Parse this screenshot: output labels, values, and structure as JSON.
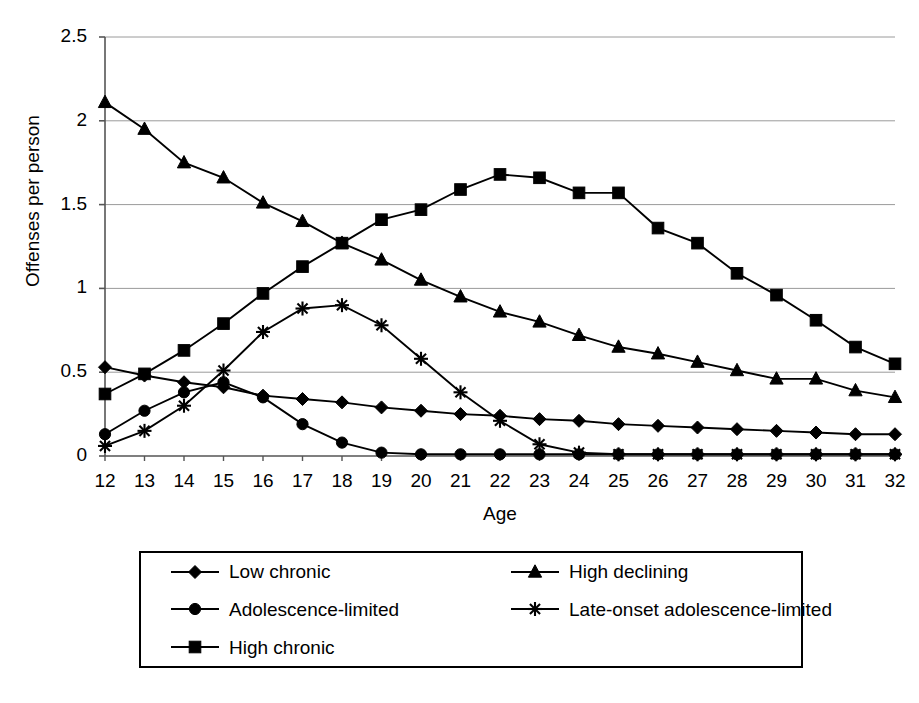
{
  "chart_data": {
    "type": "line",
    "title": "",
    "xlabel": "Age",
    "ylabel": "Offenses per person",
    "xlim": [
      12,
      32
    ],
    "ylim": [
      0,
      2.5
    ],
    "ytick_labels": [
      "0",
      "0.5",
      "1",
      "1.5",
      "2",
      "2.5"
    ],
    "ytick_values": [
      0,
      0.5,
      1,
      1.5,
      2,
      2.5
    ],
    "grid": "horizontal",
    "legend_position": "below",
    "categories": [
      12,
      13,
      14,
      15,
      16,
      17,
      18,
      19,
      20,
      21,
      22,
      23,
      24,
      25,
      26,
      27,
      28,
      29,
      30,
      31,
      32
    ],
    "series": [
      {
        "name": "Low chronic",
        "marker": "diamond",
        "values": [
          0.53,
          0.48,
          0.44,
          0.41,
          0.36,
          0.34,
          0.32,
          0.29,
          0.27,
          0.25,
          0.24,
          0.22,
          0.21,
          0.19,
          0.18,
          0.17,
          0.16,
          0.15,
          0.14,
          0.13,
          0.13
        ]
      },
      {
        "name": "Adolescence-limited",
        "marker": "circle",
        "values": [
          0.13,
          0.27,
          0.38,
          0.44,
          0.35,
          0.19,
          0.08,
          0.02,
          0.01,
          0.01,
          0.01,
          0.01,
          0.01,
          0.01,
          0.01,
          0.01,
          0.01,
          0.01,
          0.01,
          0.01,
          0.01
        ]
      },
      {
        "name": "High chronic",
        "marker": "square",
        "values": [
          0.37,
          0.49,
          0.63,
          0.79,
          0.97,
          1.13,
          1.27,
          1.41,
          1.47,
          1.59,
          1.68,
          1.66,
          1.57,
          1.57,
          1.36,
          1.27,
          1.09,
          0.96,
          0.81,
          0.65,
          0.55
        ]
      },
      {
        "name": "High declining",
        "marker": "triangle",
        "values": [
          2.11,
          1.95,
          1.75,
          1.66,
          1.51,
          1.4,
          1.27,
          1.17,
          1.05,
          0.95,
          0.86,
          0.8,
          0.72,
          0.65,
          0.61,
          0.56,
          0.51,
          0.46,
          0.46,
          0.39,
          0.35
        ]
      },
      {
        "name": "Late-onset adolescence-limited",
        "marker": "asterisk",
        "values": [
          0.06,
          0.15,
          0.3,
          0.51,
          0.74,
          0.88,
          0.9,
          0.78,
          0.58,
          0.38,
          0.21,
          0.07,
          0.02,
          0.01,
          0.01,
          0.01,
          0.01,
          0.01,
          0.01,
          0.01,
          0.01
        ]
      }
    ]
  },
  "legend": {
    "items": [
      {
        "label": "Low chronic",
        "marker": "diamond"
      },
      {
        "label": "High declining",
        "marker": "triangle"
      },
      {
        "label": "Adolescence-limited",
        "marker": "circle"
      },
      {
        "label": "Late-onset adolescence-limited",
        "marker": "asterisk"
      },
      {
        "label": "High chronic",
        "marker": "square"
      }
    ]
  },
  "colors": {
    "line": "#000000",
    "grid": "#9a9a9a",
    "axis": "#555555",
    "background": "#ffffff"
  }
}
